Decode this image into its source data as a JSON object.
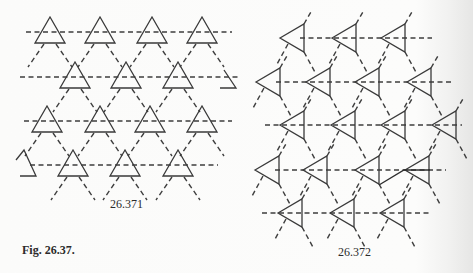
{
  "figure": {
    "caption": "Fig. 26.37.",
    "panels": [
      {
        "label": "26.371",
        "orientation": "up",
        "triangles": [
          [
            50,
            17
          ],
          [
            100,
            17
          ],
          [
            152,
            17
          ],
          [
            202,
            17
          ],
          [
            75,
            62
          ],
          [
            126,
            62
          ],
          [
            178,
            62
          ],
          [
            47,
            106
          ],
          [
            100,
            106
          ],
          [
            150,
            106
          ],
          [
            202,
            106
          ],
          [
            73,
            150
          ],
          [
            125,
            150
          ],
          [
            178,
            150
          ]
        ],
        "partial_triangles": [
          [
            228,
            66
          ],
          [
            25,
            150
          ]
        ]
      },
      {
        "label": "26.372",
        "orientation": "left",
        "triangles": [
          [
            280,
            38
          ],
          [
            332,
            38
          ],
          [
            381,
            38
          ],
          [
            256,
            82
          ],
          [
            306,
            82
          ],
          [
            355,
            82
          ],
          [
            407,
            82
          ],
          [
            280,
            125
          ],
          [
            331,
            125
          ],
          [
            381,
            125
          ],
          [
            432,
            125
          ],
          [
            255,
            170
          ],
          [
            303,
            170
          ],
          [
            355,
            170
          ],
          [
            405,
            170
          ],
          [
            278,
            213
          ],
          [
            330,
            213
          ],
          [
            380,
            213
          ]
        ]
      }
    ]
  }
}
